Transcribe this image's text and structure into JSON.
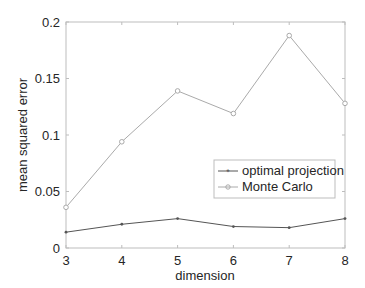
{
  "chart_data": {
    "type": "line",
    "title": "",
    "xlabel": "dimension",
    "ylabel": "mean squared error",
    "x": [
      3,
      4,
      5,
      6,
      7,
      8
    ],
    "xlim": [
      3,
      8
    ],
    "ylim": [
      0,
      0.2
    ],
    "xticks": [
      "3",
      "4",
      "5",
      "6",
      "7",
      "8"
    ],
    "yticks": [
      "0",
      "0.05",
      "0.1",
      "0.15",
      "0.2"
    ],
    "grid": false,
    "legend_position": "inside-right-middle",
    "series": [
      {
        "name": "optimal projection",
        "marker": "*",
        "color": "#555555",
        "values": [
          0.014,
          0.021,
          0.026,
          0.019,
          0.018,
          0.026
        ]
      },
      {
        "name": "Monte Carlo",
        "marker": "o",
        "color": "#aaaaaa",
        "values": [
          0.036,
          0.094,
          0.139,
          0.119,
          0.188,
          0.128
        ]
      }
    ]
  },
  "axes": {
    "xlabel": "dimension",
    "ylabel": "mean squared error",
    "xtick_labels": [
      "3",
      "4",
      "5",
      "6",
      "7",
      "8"
    ],
    "ytick_labels": [
      "0",
      "0.05",
      "0.1",
      "0.15",
      "0.2"
    ]
  },
  "legend": {
    "items": [
      {
        "label": "optimal projection"
      },
      {
        "label": "Monte Carlo"
      }
    ]
  }
}
